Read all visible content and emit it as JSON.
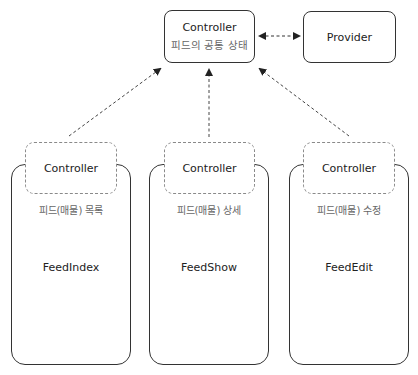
{
  "top": {
    "controller": {
      "title": "Controller",
      "subtitle": "피드의 공통 상태"
    },
    "provider": {
      "title": "Provider"
    }
  },
  "columns": [
    {
      "controller": "Controller",
      "label": "피드(매물) 목록",
      "component": "FeedIndex"
    },
    {
      "controller": "Controller",
      "label": "피드(매물) 상세",
      "component": "FeedShow"
    },
    {
      "controller": "Controller",
      "label": "피드(매물) 수정",
      "component": "FeedEdit"
    }
  ],
  "colors": {
    "border": "#333333",
    "dashed": "#8a8a8a",
    "arrow": "#333333"
  }
}
